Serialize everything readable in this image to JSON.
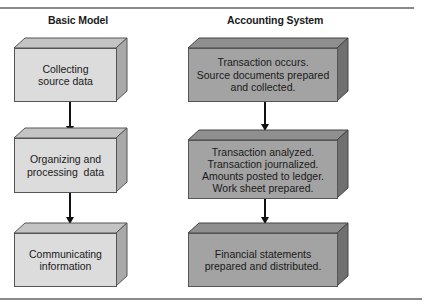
{
  "diagram": {
    "columns": [
      {
        "title": "Basic Model",
        "style": "light",
        "steps": [
          {
            "lines": [
              "Collecting",
              "source data"
            ]
          },
          {
            "lines": [
              "Organizing and",
              "processing  data"
            ]
          },
          {
            "lines": [
              "Communicating",
              "information"
            ]
          }
        ]
      },
      {
        "title": "Accounting System",
        "style": "dark",
        "steps": [
          {
            "lines": [
              "Transaction occurs.",
              "Source documents prepared",
              "and collected."
            ]
          },
          {
            "lines": [
              "Transaction analyzed.",
              "Transaction journalized.",
              "Amounts posted to ledger.",
              "Work sheet prepared."
            ]
          },
          {
            "lines": [
              "Financial statements",
              "prepared and distributed."
            ]
          }
        ]
      }
    ],
    "colors": {
      "light_front": "#dcdcdc",
      "light_top": "#c4c4c4",
      "light_side": "#a9a9a9",
      "dark_front": "#a3a3a3",
      "dark_top": "#8f8f8f",
      "dark_side": "#707070",
      "rule": "#8a8a8a",
      "arrow": "#111111"
    }
  }
}
